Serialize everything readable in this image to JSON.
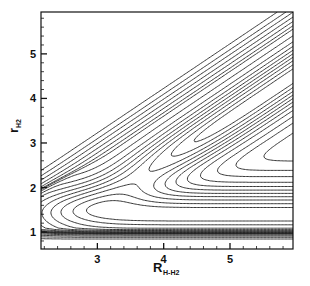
{
  "chart_data": {
    "type": "contour",
    "title": "",
    "xlabel": "R",
    "xlabel_sub": "H-H2",
    "ylabel": "r",
    "ylabel_sub": "H2",
    "xlim": [
      2.15,
      5.95
    ],
    "ylim": [
      0.62,
      5.94
    ],
    "xticks": [
      3,
      4,
      5
    ],
    "yticks": [
      1,
      2,
      3,
      4,
      5
    ],
    "x_minor_step": 0.2,
    "y_minor_step": 0.2,
    "grid": false,
    "legend": null,
    "line_color": "#222222",
    "surface": {
      "description": "L-shaped valley: H2 bond valley along r≈1.4 for large R, repulsive wall along r≈R-1.4 diagonal, plateau at upper right",
      "valley_r0": 1.4,
      "valley_width": 0.55,
      "diag_offset": 1.45,
      "diag_width": 0.5,
      "plateau_level": 1.0
    },
    "contour_levels": [
      0.08,
      0.16,
      0.26,
      0.36,
      0.46,
      0.56,
      0.66,
      0.76,
      0.86,
      0.93,
      0.98,
      1.1,
      1.3,
      1.6,
      2.0,
      2.6
    ]
  }
}
